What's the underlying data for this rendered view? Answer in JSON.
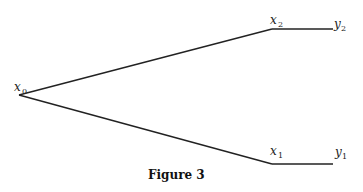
{
  "figure": {
    "caption": "Figure 3",
    "nodes": [
      {
        "id": "x0",
        "base": "x",
        "sub": "0",
        "x": 19,
        "y": 95
      },
      {
        "id": "x2",
        "base": "x",
        "sub": "2",
        "x": 272,
        "y": 29
      },
      {
        "id": "y2",
        "base": "y",
        "sub": "2",
        "x": 333,
        "y": 29
      },
      {
        "id": "x1",
        "base": "x",
        "sub": "1",
        "x": 272,
        "y": 164
      },
      {
        "id": "y1",
        "base": "y",
        "sub": "1",
        "x": 333,
        "y": 164
      }
    ],
    "edges": [
      {
        "from": "x0",
        "to": "x2"
      },
      {
        "from": "x2",
        "to": "y2"
      },
      {
        "from": "x0",
        "to": "x1"
      },
      {
        "from": "x1",
        "to": "y1"
      }
    ],
    "labels": {
      "x0": {
        "base": "x",
        "sub": "0"
      },
      "x1": {
        "base": "x",
        "sub": "1"
      },
      "x2": {
        "base": "x",
        "sub": "2"
      },
      "y1": {
        "base": "y",
        "sub": "1"
      },
      "y2": {
        "base": "y",
        "sub": "2"
      }
    },
    "line_color": "#222222"
  }
}
